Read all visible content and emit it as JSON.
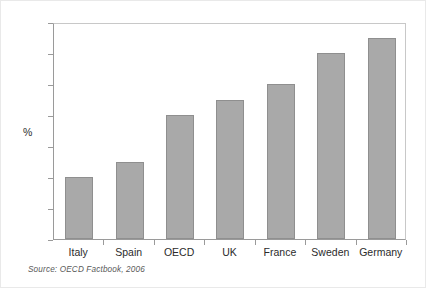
{
  "figure": {
    "source_note": "Source:  OECD Factbook, 2006",
    "background_color": "#ffffff",
    "bar_color": "#a9a9a9",
    "bar_border_color": "#8f8f8f",
    "axis_color": "#9a9a9a",
    "text_color": "#2b2b2b"
  },
  "chart_data": {
    "type": "bar",
    "title": "",
    "subtitle": "",
    "xlabel": "",
    "ylabel": "%",
    "categories": [
      "Italy",
      "Spain",
      "OECD",
      "UK",
      "France",
      "Sweden",
      "Germany"
    ],
    "values": [
      4,
      5,
      8,
      9,
      10,
      12,
      13
    ],
    "ylim": [
      0,
      14
    ],
    "ytick_step": 2,
    "yticks": [
      0,
      2,
      4,
      6,
      8,
      10,
      12,
      14
    ],
    "ytick_labels": [
      "0",
      "2",
      "4",
      "6",
      "8",
      "10",
      "12",
      "14"
    ],
    "grid": false,
    "legend": null,
    "legend_position": "none",
    "annotations": [
      "Source:  OECD Factbook, 2006"
    ]
  }
}
